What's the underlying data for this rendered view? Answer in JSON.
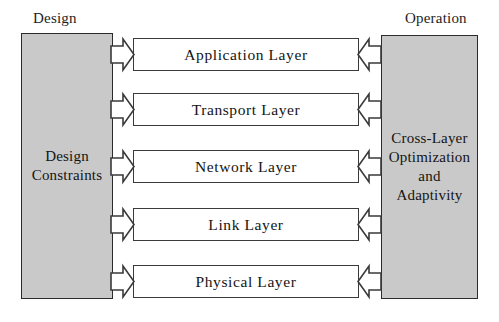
{
  "diagram": {
    "title_left": "Design",
    "title_right": "Operation",
    "left_block": {
      "name": "design-constraints",
      "text": "Design\nConstraints",
      "fill": "#c9c9c9"
    },
    "right_block": {
      "name": "cross-layer-optimization",
      "text": "Cross-Layer\nOptimization\nand\nAdaptivity",
      "fill": "#c9c9c9"
    },
    "layers": [
      {
        "label": "Application Layer"
      },
      {
        "label": "Transport Layer"
      },
      {
        "label": "Network Layer"
      },
      {
        "label": "Link Layer"
      },
      {
        "label": "Physical Layer"
      }
    ],
    "arrows": {
      "left_direction": "right",
      "right_direction": "left",
      "count_per_side": 5,
      "stroke": "#3a3a3a",
      "fill": "#ffffff"
    }
  }
}
